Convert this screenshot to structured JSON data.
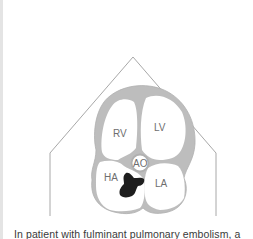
{
  "figure": {
    "type": "heart-cross-section-diagram",
    "labels": {
      "rv": "RV",
      "lv": "LV",
      "ao": "AO",
      "ha": "HA",
      "la": "LA"
    },
    "colors": {
      "outline": "#9a9a9a",
      "myocardium": "#bdbdbd",
      "chamber": "#ffffff",
      "thrombus": "#1e1e1e",
      "label": "#6e6e6e"
    }
  },
  "caption": {
    "text": "In patient with fulminant pulmonary embolism, a"
  }
}
